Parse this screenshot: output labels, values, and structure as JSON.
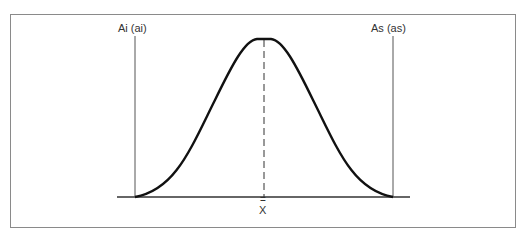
{
  "diagram": {
    "type": "normal-distribution-curve",
    "labels": {
      "lower_limit": "Ai (ai)",
      "upper_limit": "As (as)",
      "mean_symbol": "=",
      "mean_letter": "X"
    },
    "colors": {
      "curve": "#111111",
      "axis": "#333333",
      "limit_lines": "#555555",
      "frame": "#8a8a8a",
      "mean_line": "#333333"
    }
  }
}
